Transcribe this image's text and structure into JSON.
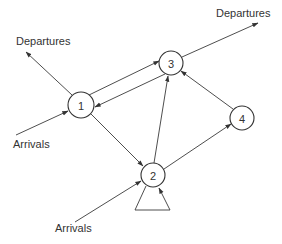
{
  "diagram": {
    "type": "queueing-network",
    "nodes": [
      {
        "id": "1",
        "label": "1",
        "cx": 81,
        "cy": 105,
        "r": 13
      },
      {
        "id": "2",
        "label": "2",
        "cx": 153,
        "cy": 175,
        "r": 12
      },
      {
        "id": "3",
        "label": "3",
        "cx": 171,
        "cy": 63,
        "r": 12
      },
      {
        "id": "4",
        "label": "4",
        "cx": 242,
        "cy": 118,
        "r": 12
      }
    ],
    "edges": [
      {
        "from": "1",
        "to": "3"
      },
      {
        "from": "3",
        "to": "1"
      },
      {
        "from": "1",
        "to": "2"
      },
      {
        "from": "2",
        "to": "3"
      },
      {
        "from": "2",
        "to": "4"
      },
      {
        "from": "4",
        "to": "3"
      },
      {
        "from": "2",
        "to": "2",
        "kind": "self-loop"
      },
      {
        "from": "1",
        "to": "external",
        "label": "Departures"
      },
      {
        "from": "3",
        "to": "external",
        "label": "Departures"
      },
      {
        "from": "external",
        "to": "1",
        "label": "Arrivals"
      },
      {
        "from": "external",
        "to": "2",
        "label": "Arrivals"
      }
    ],
    "labels": {
      "departures_left": "Departures",
      "departures_right": "Departures",
      "arrivals_left": "Arrivals",
      "arrivals_bottom": "Arrivals"
    },
    "colors": {
      "stroke": "#333333",
      "background": "#ffffff"
    }
  }
}
